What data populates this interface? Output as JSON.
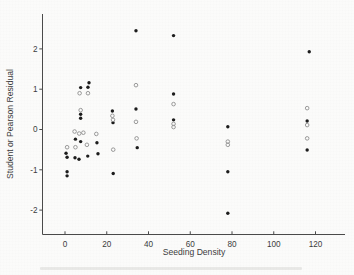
{
  "chart_data": {
    "type": "scatter",
    "title": "",
    "xlabel": "Seeding Density",
    "ylabel": "Student or Pearson Residual",
    "xlim": [
      -11,
      134
    ],
    "ylim": [
      -2.6,
      2.87
    ],
    "x_ticks": [
      0,
      20,
      40,
      60,
      80,
      100,
      120
    ],
    "y_ticks": [
      -2,
      -1,
      0,
      1,
      2
    ],
    "grid": false,
    "legend": "none",
    "colors": {
      "filled_point": "#1c1c1c",
      "open_point_stroke": "#8f8f8f",
      "axis": "#4a4a4a",
      "text": "#3c3c3c",
      "background": "#fbfbfa"
    },
    "series": [
      {
        "name": "filled-circles",
        "marker": "filled-circle",
        "points": [
          [
            0.5,
            -0.59
          ],
          [
            1,
            -0.69
          ],
          [
            1,
            -1.05
          ],
          [
            1,
            -1.15
          ],
          [
            5,
            -0.24
          ],
          [
            4.8,
            -0.7
          ],
          [
            7.5,
            1.04
          ],
          [
            7.5,
            0.38
          ],
          [
            7.5,
            0.28
          ],
          [
            7.5,
            -0.3
          ],
          [
            6.7,
            -0.74
          ],
          [
            11.5,
            1.16
          ],
          [
            11,
            1.05
          ],
          [
            10.9,
            -0.66
          ],
          [
            15.3,
            -0.33
          ],
          [
            15.8,
            -0.6
          ],
          [
            22.7,
            0.46
          ],
          [
            23,
            0.17
          ],
          [
            23.1,
            -1.09
          ],
          [
            34,
            2.45
          ],
          [
            34,
            0.51
          ],
          [
            34.6,
            -0.45
          ],
          [
            52,
            2.33
          ],
          [
            52,
            0.88
          ],
          [
            52,
            0.24
          ],
          [
            78,
            0.07
          ],
          [
            78,
            -1.05
          ],
          [
            78,
            -2.08
          ],
          [
            117,
            1.93
          ],
          [
            116,
            0.21
          ],
          [
            116,
            -0.51
          ]
        ]
      },
      {
        "name": "open-circles",
        "marker": "open-circle",
        "points": [
          [
            1,
            -0.44
          ],
          [
            5,
            -0.44
          ],
          [
            4.6,
            -0.05
          ],
          [
            7,
            0.9
          ],
          [
            7.5,
            0.48
          ],
          [
            6.8,
            -0.1
          ],
          [
            8.8,
            -0.08
          ],
          [
            11,
            0.9
          ],
          [
            10.5,
            -0.38
          ],
          [
            15,
            -0.11
          ],
          [
            22.7,
            0.34
          ],
          [
            23,
            0.24
          ],
          [
            23.1,
            -0.5
          ],
          [
            34,
            1.1
          ],
          [
            34,
            0.19
          ],
          [
            34.3,
            -0.22
          ],
          [
            52,
            0.63
          ],
          [
            52,
            0.14
          ],
          [
            52,
            0.06
          ],
          [
            78,
            -0.3
          ],
          [
            78,
            -0.38
          ],
          [
            116,
            0.53
          ],
          [
            116,
            0.11
          ],
          [
            116,
            -0.22
          ]
        ]
      }
    ]
  }
}
